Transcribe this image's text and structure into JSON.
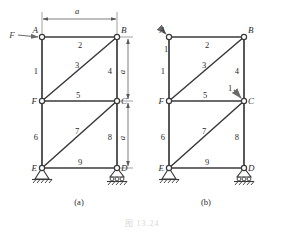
{
  "figure": {
    "caption": "图 13.24",
    "panels": [
      {
        "id": "a",
        "label": "(a)",
        "joints": [
          {
            "name": "A",
            "label": "A"
          },
          {
            "name": "B",
            "label": "B"
          },
          {
            "name": "C",
            "label": "C"
          },
          {
            "name": "D",
            "label": "D"
          },
          {
            "name": "E",
            "label": "E"
          },
          {
            "name": "F",
            "label": "F"
          }
        ],
        "members": [
          {
            "id": "1",
            "label": "1",
            "from": "A",
            "to": "F"
          },
          {
            "id": "2",
            "label": "2",
            "from": "A",
            "to": "B"
          },
          {
            "id": "3",
            "label": "3",
            "from": "F",
            "to": "B"
          },
          {
            "id": "4",
            "label": "4",
            "from": "B",
            "to": "C"
          },
          {
            "id": "5",
            "label": "5",
            "from": "F",
            "to": "C"
          },
          {
            "id": "6",
            "label": "6",
            "from": "F",
            "to": "E"
          },
          {
            "id": "7",
            "label": "7",
            "from": "E",
            "to": "C"
          },
          {
            "id": "8",
            "label": "8",
            "from": "C",
            "to": "D"
          },
          {
            "id": "9",
            "label": "9",
            "from": "E",
            "to": "D"
          }
        ],
        "dimensions": [
          {
            "name": "top-span",
            "label": "a"
          },
          {
            "name": "upper-height",
            "label": "a"
          },
          {
            "name": "lower-height",
            "label": "a"
          }
        ],
        "loads": [
          {
            "name": "force-F-at-A",
            "label": "F",
            "at": "A",
            "direction": "right"
          }
        ],
        "supports": [
          {
            "name": "pin-support-E",
            "at": "E",
            "type": "pin"
          },
          {
            "name": "roller-support-D",
            "at": "D",
            "type": "roller"
          }
        ]
      },
      {
        "id": "b",
        "label": "(b)",
        "joints": [
          {
            "name": "A",
            "label": "A"
          },
          {
            "name": "B",
            "label": "B"
          },
          {
            "name": "C",
            "label": "C"
          },
          {
            "name": "D",
            "label": "D"
          },
          {
            "name": "E",
            "label": "E"
          },
          {
            "name": "F",
            "label": "F"
          }
        ],
        "members": [
          {
            "id": "1",
            "label": "1",
            "from": "A",
            "to": "F"
          },
          {
            "id": "2",
            "label": "2",
            "from": "A",
            "to": "B"
          },
          {
            "id": "3",
            "label": "3",
            "from": "F",
            "to": "B"
          },
          {
            "id": "4",
            "label": "4",
            "from": "B",
            "to": "C"
          },
          {
            "id": "5",
            "label": "5",
            "from": "F",
            "to": "C"
          },
          {
            "id": "6",
            "label": "6",
            "from": "F",
            "to": "E"
          },
          {
            "id": "7",
            "label": "7",
            "from": "E",
            "to": "C"
          },
          {
            "id": "8",
            "label": "8",
            "from": "C",
            "to": "D"
          },
          {
            "id": "9",
            "label": "9",
            "from": "E",
            "to": "D"
          }
        ],
        "loads": [
          {
            "name": "unit-load-at-A",
            "label": "1",
            "at": "A",
            "direction": "down-right"
          },
          {
            "name": "unit-load-at-C",
            "label": "1",
            "at": "C",
            "direction": "down-right"
          }
        ],
        "supports": [
          {
            "name": "pin-support-E",
            "at": "E",
            "type": "pin"
          },
          {
            "name": "roller-support-D",
            "at": "D",
            "type": "roller"
          }
        ]
      }
    ],
    "colors": {
      "member": "#3a3a3a",
      "joint_fill": "#ffffff",
      "dimension": "#5a5a5a",
      "load": "#6a6a6a",
      "caption": "#d8d8d8"
    }
  }
}
